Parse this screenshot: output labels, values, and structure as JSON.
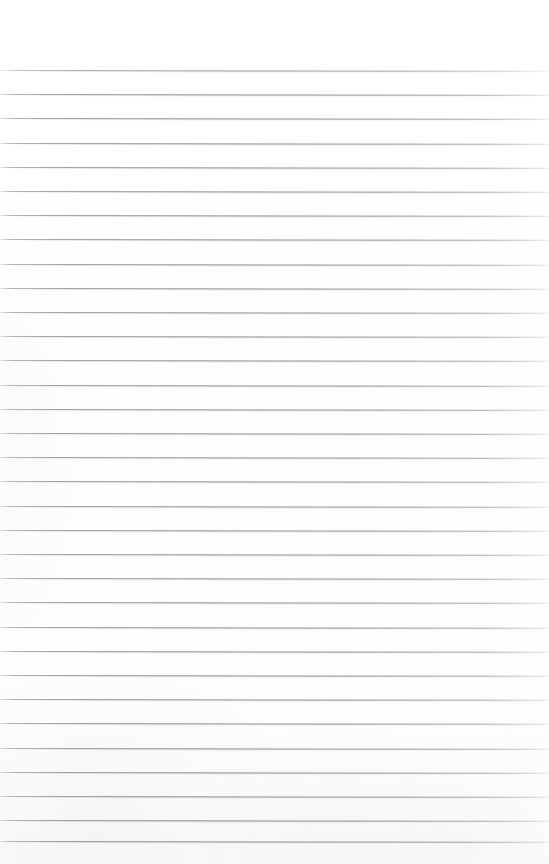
{
  "document": {
    "kind": "scanned-blank-ruled-page",
    "title": "Blank Ruled Notebook Page",
    "description": "Scan of an empty lined writing sheet with no handwriting, text, headings or marginalia.",
    "orientation": "portrait",
    "page_width_px": 549,
    "page_height_px": 864,
    "background_color": "#ffffff",
    "has_text_content": "false",
    "has_handwriting": "false",
    "has_margin_rule": "false",
    "has_header": "false",
    "has_footer": "false",
    "has_page_number": "false",
    "body_text": ""
  },
  "ruling": {
    "style": "horizontal-single-rule",
    "line_color": "#868791",
    "line_color_light": "#abacb2",
    "line_thickness_px": 1,
    "line_spacing_px": 24.2,
    "first_line_y_px": 70,
    "last_line_y_px": 841,
    "line_count": 33,
    "left_inset_px": 0,
    "right_inset_px": 0,
    "top_margin_px": 70,
    "bottom_margin_px": 23,
    "skew_degrees": 0.085,
    "lines": [
      {
        "index": 1,
        "y": 70.0,
        "content": ""
      },
      {
        "index": 2,
        "y": 94.2,
        "content": ""
      },
      {
        "index": 3,
        "y": 118.4,
        "content": ""
      },
      {
        "index": 4,
        "y": 142.6,
        "content": ""
      },
      {
        "index": 5,
        "y": 166.8,
        "content": ""
      },
      {
        "index": 6,
        "y": 191.0,
        "content": ""
      },
      {
        "index": 7,
        "y": 215.2,
        "content": ""
      },
      {
        "index": 8,
        "y": 239.4,
        "content": ""
      },
      {
        "index": 9,
        "y": 263.6,
        "content": ""
      },
      {
        "index": 10,
        "y": 287.8,
        "content": ""
      },
      {
        "index": 11,
        "y": 312.0,
        "content": ""
      },
      {
        "index": 12,
        "y": 336.2,
        "content": ""
      },
      {
        "index": 13,
        "y": 360.4,
        "content": ""
      },
      {
        "index": 14,
        "y": 384.6,
        "content": ""
      },
      {
        "index": 15,
        "y": 408.8,
        "content": ""
      },
      {
        "index": 16,
        "y": 433.0,
        "content": ""
      },
      {
        "index": 17,
        "y": 457.2,
        "content": ""
      },
      {
        "index": 18,
        "y": 481.4,
        "content": ""
      },
      {
        "index": 19,
        "y": 505.6,
        "content": ""
      },
      {
        "index": 20,
        "y": 529.8,
        "content": ""
      },
      {
        "index": 21,
        "y": 554.0,
        "content": ""
      },
      {
        "index": 22,
        "y": 578.2,
        "content": ""
      },
      {
        "index": 23,
        "y": 602.4,
        "content": ""
      },
      {
        "index": 24,
        "y": 626.6,
        "content": ""
      },
      {
        "index": 25,
        "y": 650.8,
        "content": ""
      },
      {
        "index": 26,
        "y": 675.0,
        "content": ""
      },
      {
        "index": 27,
        "y": 699.2,
        "content": ""
      },
      {
        "index": 28,
        "y": 723.4,
        "content": ""
      },
      {
        "index": 29,
        "y": 747.6,
        "content": ""
      },
      {
        "index": 30,
        "y": 771.8,
        "content": ""
      },
      {
        "index": 31,
        "y": 796.0,
        "content": ""
      },
      {
        "index": 32,
        "y": 820.2,
        "content": ""
      },
      {
        "index": 33,
        "y": 841.0,
        "content": ""
      }
    ]
  }
}
